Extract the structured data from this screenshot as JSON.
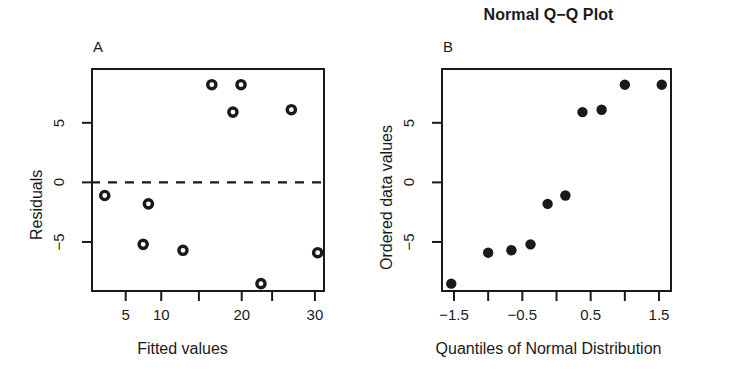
{
  "figure": {
    "width": 731,
    "height": 384,
    "background": "#ffffff",
    "ink": "#1a1a1a"
  },
  "panels": {
    "a": {
      "letter": "A",
      "title": "",
      "xlabel": "Fitted values",
      "ylabel": "Residuals"
    },
    "b": {
      "letter": "B",
      "title": "Normal Q−Q Plot",
      "xlabel": "Quantiles of Normal Distribution",
      "ylabel": "Ordered data values"
    }
  },
  "chart_data": [
    {
      "type": "scatter",
      "panel": "A",
      "title": "",
      "xlabel": "Fitted values",
      "ylabel": "Residuals",
      "xscale": "log",
      "xlim": [
        3.6,
        33.0
      ],
      "ylim": [
        -9.2,
        9.6
      ],
      "grid": false,
      "legend": null,
      "xticks": [
        5,
        7,
        10,
        15,
        20,
        30
      ],
      "xtick_labels": [
        "5",
        "10",
        "",
        "20",
        "",
        "30"
      ],
      "xtick_labels_shown": [
        "5",
        "10",
        "20",
        "30"
      ],
      "yticks": [
        -5,
        0,
        5
      ],
      "ytick_labels": [
        "−5",
        "0",
        "5"
      ],
      "reference_line": {
        "type": "hline",
        "y": 0,
        "style": "dashed"
      },
      "marker": "open-circle",
      "points": [
        {
          "x": 4.1,
          "y": -1.1
        },
        {
          "x": 6.2,
          "y": -1.8
        },
        {
          "x": 5.9,
          "y": -5.2
        },
        {
          "x": 8.6,
          "y": -5.7
        },
        {
          "x": 11.3,
          "y": 8.2
        },
        {
          "x": 13.8,
          "y": 5.9
        },
        {
          "x": 14.9,
          "y": 8.2
        },
        {
          "x": 18.0,
          "y": -8.5
        },
        {
          "x": 24.0,
          "y": 6.1
        },
        {
          "x": 30.8,
          "y": -5.9
        }
      ]
    },
    {
      "type": "scatter",
      "panel": "B",
      "title": "Normal Q−Q Plot",
      "xlabel": "Quantiles of Normal Distribution",
      "ylabel": "Ordered data values",
      "xscale": "linear",
      "xlim": [
        -1.69,
        1.69
      ],
      "ylim": [
        -9.2,
        9.6
      ],
      "grid": false,
      "legend": null,
      "xticks": [
        -1.5,
        -1.0,
        -0.5,
        0.0,
        0.5,
        1.0,
        1.5
      ],
      "xtick_labels": [
        "−1.5",
        "",
        "−0.5",
        "",
        "0.5",
        "",
        "1.5"
      ],
      "xtick_labels_shown": [
        "−1.5",
        "−0.5",
        "0.5",
        "1.5"
      ],
      "yticks": [
        -5,
        0,
        5
      ],
      "ytick_labels": [
        "−5",
        "0",
        "5"
      ],
      "marker": "filled-circle",
      "points": [
        {
          "x": -1.54,
          "y": -8.5
        },
        {
          "x": -1.0,
          "y": -5.9
        },
        {
          "x": -0.66,
          "y": -5.7
        },
        {
          "x": -0.38,
          "y": -5.2
        },
        {
          "x": -0.13,
          "y": -1.8
        },
        {
          "x": 0.13,
          "y": -1.1
        },
        {
          "x": 0.38,
          "y": 5.9
        },
        {
          "x": 0.66,
          "y": 6.1
        },
        {
          "x": 1.0,
          "y": 8.2
        },
        {
          "x": 1.54,
          "y": 8.2
        }
      ]
    }
  ]
}
